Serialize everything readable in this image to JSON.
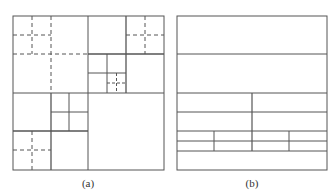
{
  "figure": {
    "panels": [
      {
        "id": "a",
        "label": "(a)",
        "description": "Quadtree-style recursive square subdivision with solid and dashed partition lines"
      },
      {
        "id": "b",
        "label": "(b)",
        "description": "Horizontal strip partition with progressively finer subdivisions toward the bottom"
      }
    ],
    "colors": {
      "line": "#555555",
      "background": "#ffffff"
    }
  }
}
